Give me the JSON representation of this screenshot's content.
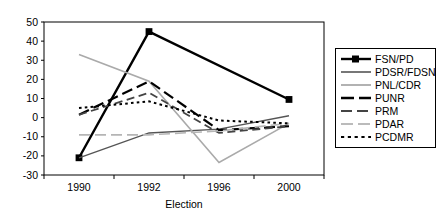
{
  "chart_data": {
    "type": "line",
    "title": "",
    "xlabel": "Election",
    "ylabel": "",
    "x": [
      "1990",
      "1992",
      "1996",
      "2000"
    ],
    "categories": [
      "1990",
      "1992",
      "1996",
      "2000"
    ],
    "ylim": [
      -30,
      50
    ],
    "ytick_labels": [
      "50",
      "40",
      "30",
      "20",
      "10",
      "0",
      "-10",
      "-20",
      "-30"
    ],
    "ytick_values": [
      50,
      40,
      30,
      20,
      10,
      0,
      -10,
      -20,
      -30
    ],
    "grid": false,
    "legend_position": "right",
    "series": [
      {
        "name": "FSN/PD",
        "values": [
          -21,
          45,
          null,
          9.5
        ],
        "color": "#000000",
        "style": "solid-marker",
        "width": 2.4,
        "marker": "square"
      },
      {
        "name": "PDSR/FDSN",
        "values": [
          -21,
          -8,
          -6,
          1
        ],
        "color": "#555555",
        "style": "solid",
        "width": 1.4,
        "marker": "none"
      },
      {
        "name": "PNL/CDR",
        "values": [
          33,
          19,
          -23.5,
          -3
        ],
        "color": "#aaaaaa",
        "style": "solid",
        "width": 1.6,
        "marker": "none"
      },
      {
        "name": "PUNR",
        "values": [
          1.5,
          19,
          -6.5,
          -4.5
        ],
        "color": "#000000",
        "style": "long-dash",
        "width": 2.2,
        "marker": "none"
      },
      {
        "name": "PRM",
        "values": [
          1.5,
          13,
          -8,
          -4.5
        ],
        "color": "#444444",
        "style": "medium-dash",
        "width": 1.8,
        "marker": "none"
      },
      {
        "name": "PDAR",
        "values": [
          -9,
          -9,
          -7,
          -3
        ],
        "color": "#b5b5b5",
        "style": "long-dash",
        "width": 1.6,
        "marker": "none"
      },
      {
        "name": "PCDMR",
        "values": [
          5,
          8.5,
          -1.5,
          -3
        ],
        "color": "#000000",
        "style": "dotted",
        "width": 2.0,
        "marker": "none"
      }
    ]
  },
  "legend": {
    "items": [
      {
        "label": "FSN/PD"
      },
      {
        "label": "PDSR/FDSN"
      },
      {
        "label": "PNL/CDR"
      },
      {
        "label": "PUNR"
      },
      {
        "label": "PRM"
      },
      {
        "label": "PDAR"
      },
      {
        "label": "PCDMR"
      }
    ]
  },
  "axes": {
    "x_title": "Election",
    "x_tick_labels": [
      "1990",
      "1992",
      "1996",
      "2000"
    ],
    "y_tick_labels": [
      "50",
      "40",
      "30",
      "20",
      "10",
      "0",
      "-10",
      "-20",
      "-30"
    ]
  }
}
